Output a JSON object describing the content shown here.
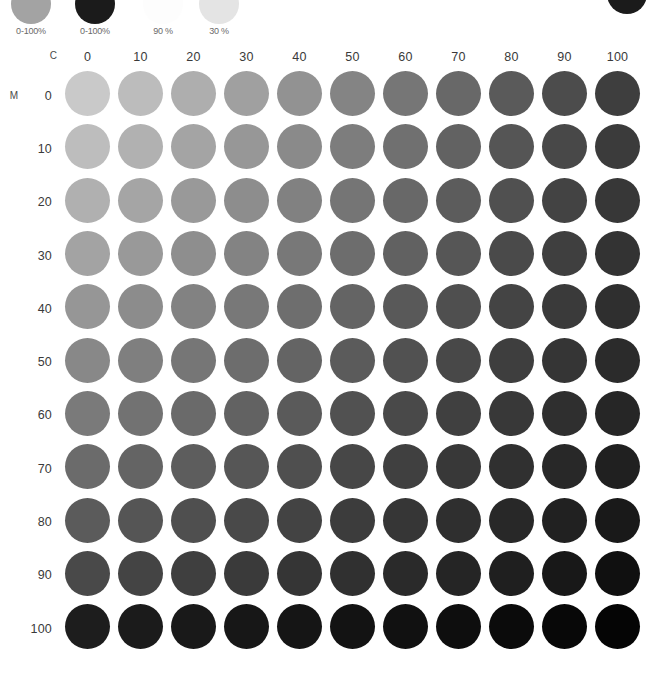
{
  "chart_data": {
    "type": "heatmap",
    "xlabel": "C",
    "ylabel": "M",
    "x_axis_caption": "C",
    "y_axis_caption": "M",
    "categories": [
      "0",
      "10",
      "20",
      "30",
      "40",
      "50",
      "60",
      "70",
      "80",
      "90",
      "100"
    ],
    "row_categories": [
      "0",
      "10",
      "20",
      "30",
      "40",
      "50",
      "60",
      "70",
      "80",
      "90",
      "100"
    ],
    "grid": false,
    "legend_position": "top",
    "unit": "%",
    "colors": [
      [
        "#c9c9c9",
        "#bcbcbc",
        "#aeaeae",
        "#a0a0a0",
        "#929292",
        "#848484",
        "#767676",
        "#686868",
        "#5a5a5a",
        "#4c4c4c",
        "#3e3e3e"
      ],
      [
        "#bdbdbd",
        "#b1b1b1",
        "#a4a4a4",
        "#979797",
        "#8a8a8a",
        "#7d7d7d",
        "#707070",
        "#626262",
        "#555555",
        "#484848",
        "#3b3b3b"
      ],
      [
        "#b0b0b0",
        "#a5a5a5",
        "#999999",
        "#8d8d8d",
        "#818181",
        "#757575",
        "#686868",
        "#5c5c5c",
        "#505050",
        "#434343",
        "#373737"
      ],
      [
        "#a3a3a3",
        "#999999",
        "#8e8e8e",
        "#838383",
        "#787878",
        "#6d6d6d",
        "#616161",
        "#565656",
        "#4a4a4a",
        "#3f3f3f",
        "#333333"
      ],
      [
        "#969696",
        "#8c8c8c",
        "#828282",
        "#787878",
        "#6e6e6e",
        "#646464",
        "#595959",
        "#4f4f4f",
        "#444444",
        "#3a3a3a",
        "#2f2f2f"
      ],
      [
        "#888888",
        "#7f7f7f",
        "#767676",
        "#6d6d6d",
        "#646464",
        "#5b5b5b",
        "#515151",
        "#484848",
        "#3e3e3e",
        "#353535",
        "#2b2b2b"
      ],
      [
        "#7a7a7a",
        "#727272",
        "#6a6a6a",
        "#626262",
        "#5a5a5a",
        "#515151",
        "#494949",
        "#404040",
        "#383838",
        "#2f2f2f",
        "#262626"
      ],
      [
        "#6b6b6b",
        "#646464",
        "#5d5d5d",
        "#565656",
        "#4f4f4f",
        "#474747",
        "#404040",
        "#383838",
        "#303030",
        "#282828",
        "#202020"
      ],
      [
        "#5b5b5b",
        "#555555",
        "#4f4f4f",
        "#494949",
        "#434343",
        "#3c3c3c",
        "#363636",
        "#2f2f2f",
        "#282828",
        "#212121",
        "#191919"
      ],
      [
        "#494949",
        "#444444",
        "#3f3f3f",
        "#3a3a3a",
        "#353535",
        "#303030",
        "#2a2a2a",
        "#252525",
        "#1f1f1f",
        "#181818",
        "#101010"
      ],
      [
        "#1d1d1d",
        "#1b1b1b",
        "#191919",
        "#171717",
        "#151515",
        "#131313",
        "#111111",
        "#0e0e0e",
        "#0b0b0b",
        "#080808",
        "#050505"
      ]
    ]
  },
  "swatches": [
    {
      "label": "0-100%",
      "color": "#a3a3a3"
    },
    {
      "label": "0-100%",
      "color": "#1b1b1b"
    },
    {
      "label": "90 %",
      "color": "#fdfdfd"
    },
    {
      "label": "30 %",
      "color": "#e4e4e4"
    }
  ],
  "corner_dot": {
    "color": "#1b1b1b"
  }
}
